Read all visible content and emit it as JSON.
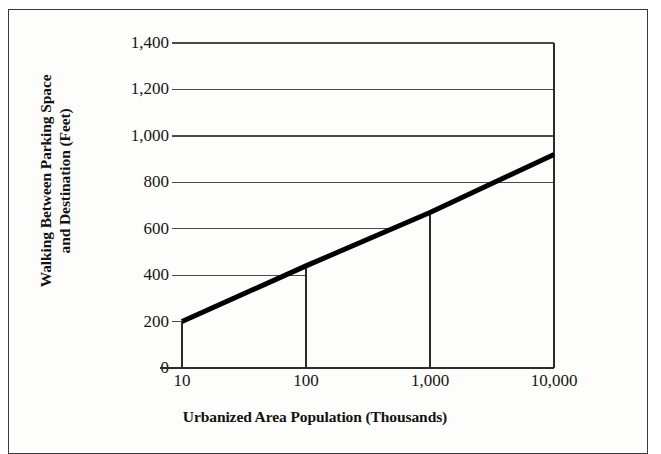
{
  "chart_data": {
    "type": "line",
    "title": "",
    "xlabel": "Urbanized Area Population (Thousands)",
    "ylabel": "Walking Between Parking Space and Destination (Feet)",
    "ylabel_line1": "Walking Between Parking Space",
    "ylabel_line2": "and Destination (Feet)",
    "xscale": "log",
    "yscale": "linear",
    "xlim": [
      10,
      10000
    ],
    "ylim": [
      0,
      1400
    ],
    "xticks": [
      10,
      100,
      1000,
      10000
    ],
    "xticklabels": [
      "10",
      "100",
      "1,000",
      "10,000"
    ],
    "yticks": [
      0,
      200,
      400,
      600,
      800,
      1000,
      1200,
      1400
    ],
    "yticklabels": [
      "0",
      "200",
      "400",
      "600",
      "800",
      "1,000",
      "1,200",
      "1,400"
    ],
    "grid": true,
    "legend": false,
    "series": [
      {
        "name": "Walking distance",
        "x": [
          10,
          100,
          1000,
          10000
        ],
        "y": [
          200,
          440,
          670,
          920
        ],
        "color": "#000000",
        "linewidth": 5
      }
    ],
    "reference_lines": [
      {
        "name": "ref-10",
        "x": 10,
        "y": 200,
        "label": "10 thousand → 200 feet"
      },
      {
        "name": "ref-100",
        "x": 100,
        "y": 400,
        "label": "100 thousand → 400 feet"
      },
      {
        "name": "ref-1000",
        "x": 1000,
        "y": 600,
        "label": "1,000 thousand → 600 feet"
      }
    ],
    "gridline_values": [
      200,
      400,
      600,
      800,
      1000,
      1200,
      1400
    ],
    "axis_color": "#2b2b2b",
    "grid_color": "#4a4a4a",
    "background": "#fdfdfb",
    "frame_color": "#3a3a3a"
  }
}
